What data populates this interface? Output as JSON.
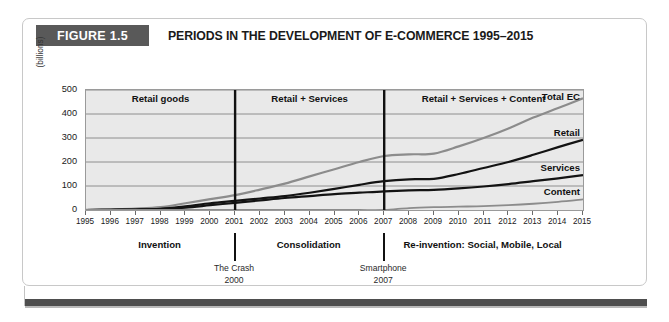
{
  "figure": {
    "badge": "FIGURE 1.5",
    "title": "PERIODS IN THE DEVELOPMENT OF E-COMMERCE 1995–2015"
  },
  "chart_data": {
    "type": "line",
    "title": "PERIODS IN THE DEVELOPMENT OF E-COMMERCE 1995–2015",
    "xlabel": "",
    "ylabel": "(billions)",
    "ylim": [
      0,
      500
    ],
    "yticks": [
      0,
      100,
      200,
      300,
      400,
      500
    ],
    "grid": true,
    "legend_position": "right-inline",
    "x": [
      1995,
      1996,
      1997,
      1998,
      1999,
      2000,
      2001,
      2002,
      2003,
      2004,
      2005,
      2006,
      2007,
      2008,
      2009,
      2010,
      2011,
      2012,
      2013,
      2014,
      2015
    ],
    "series": [
      {
        "name": "Total EC",
        "color": "#8c8c8c",
        "values": [
          1,
          3,
          6,
          12,
          28,
          45,
          62,
          85,
          110,
          140,
          170,
          200,
          225,
          232,
          235,
          265,
          300,
          340,
          385,
          425,
          465
        ]
      },
      {
        "name": "Retail",
        "color": "#131313",
        "values": [
          0,
          1,
          2,
          5,
          15,
          28,
          38,
          48,
          58,
          72,
          88,
          105,
          120,
          128,
          130,
          150,
          175,
          200,
          230,
          262,
          292
        ]
      },
      {
        "name": "Services",
        "color": "#131313",
        "values": [
          0,
          1,
          2,
          4,
          10,
          20,
          30,
          40,
          50,
          58,
          66,
          72,
          78,
          82,
          84,
          90,
          98,
          108,
          120,
          132,
          145
        ]
      },
      {
        "name": "Content",
        "color": "#8c8c8c",
        "values": [
          0,
          0,
          0,
          0,
          0,
          0,
          0,
          0,
          0,
          0,
          0,
          0,
          0,
          8,
          12,
          14,
          16,
          20,
          26,
          34,
          44
        ]
      }
    ],
    "phase_bands": [
      {
        "label": "Retail goods",
        "from": 1995,
        "to": 2001
      },
      {
        "label": "Retail + Services",
        "from": 2001,
        "to": 2007
      },
      {
        "label": "Retail + Services + Content",
        "from": 2007,
        "to": 2015
      }
    ],
    "periods": [
      {
        "label": "Invention",
        "from": 1995,
        "to": 2001
      },
      {
        "label": "Consolidation",
        "from": 2001,
        "to": 2007
      },
      {
        "label": "Re-invention: Social, Mobile, Local",
        "from": 2007,
        "to": 2015
      }
    ],
    "dividers": [
      {
        "year": 2001,
        "event": "The Crash",
        "event_year": "2000"
      },
      {
        "year": 2007,
        "event": "Smartphone",
        "event_year": "2007"
      }
    ]
  },
  "colors": {
    "badge_bg": "#595959",
    "plot_bg": "#e9e9e9",
    "grid": "#8e8e8e",
    "bottom_bar": "#4e4e4e"
  }
}
